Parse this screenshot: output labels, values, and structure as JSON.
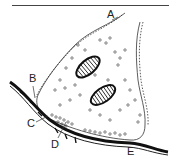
{
  "figure": {
    "labels": [
      {
        "id": "A",
        "text": "A",
        "x": 107,
        "y": 14
      },
      {
        "id": "B",
        "text": "B",
        "x": 29,
        "y": 74
      },
      {
        "id": "C",
        "text": "C",
        "x": 27,
        "y": 119
      },
      {
        "id": "D",
        "text": "D",
        "x": 51,
        "y": 140
      },
      {
        "id": "E",
        "text": "E",
        "x": 127,
        "y": 148
      }
    ],
    "elements": {
      "presynaptic_membrane": "A",
      "postsynaptic_cell": "B",
      "synaptic_cleft": "C",
      "synaptic_vesicles": "D",
      "postsynaptic_membrane": "E",
      "mitochondria_count": 2
    },
    "colors": {
      "ink": "#222222",
      "background": "#ffffff"
    }
  }
}
